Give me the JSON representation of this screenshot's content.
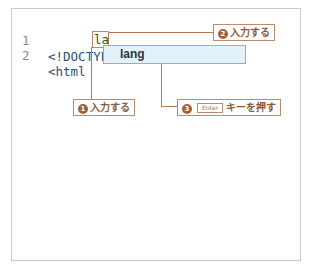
{
  "editor": {
    "lines": [
      {
        "number": "1",
        "code": "<!DOCTYPE html>"
      },
      {
        "number": "2",
        "code": "<html "
      }
    ],
    "typed_text": "la",
    "autocomplete": {
      "items": [
        {
          "label": "lang",
          "selected": true
        }
      ]
    }
  },
  "callouts": {
    "step1": {
      "num": "1",
      "label": "入力する"
    },
    "step2": {
      "num": "2",
      "label": "入力する"
    },
    "step3": {
      "num": "3",
      "key": "Enter",
      "label": "キーを押す"
    }
  },
  "colors": {
    "accent": "#a0603a",
    "border": "#b98a6c",
    "autocomplete_bg": "#e2f2fa",
    "code_text": "#1f4f7a",
    "line_number": "#8a8a8a"
  }
}
